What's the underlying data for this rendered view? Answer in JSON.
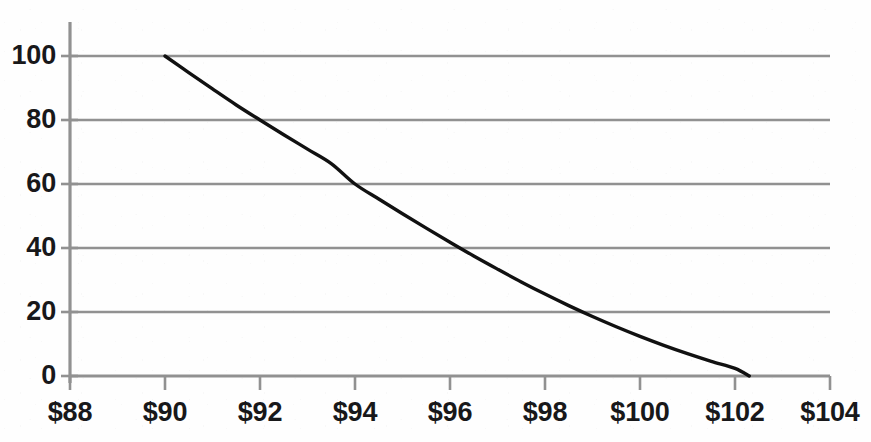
{
  "chart_data": {
    "type": "line",
    "title": "",
    "subtitle": "",
    "xlabel": "",
    "ylabel": "",
    "xlim": [
      88,
      104
    ],
    "ylim": [
      0,
      100
    ],
    "grid": "horizontal",
    "legend": "none",
    "x_tick_labels": [
      "$88",
      "$90",
      "$92",
      "$94",
      "$96",
      "$98",
      "$100",
      "$102",
      "$104"
    ],
    "x_tick_values": [
      88,
      90,
      92,
      94,
      96,
      98,
      100,
      102,
      104
    ],
    "y_tick_labels": [
      "0",
      "20",
      "40",
      "60",
      "80",
      "100"
    ],
    "y_tick_values": [
      0,
      20,
      40,
      60,
      80,
      100
    ],
    "series": [
      {
        "name": "curve",
        "color": "#111111",
        "x": [
          90.0,
          90.5,
          91.0,
          91.5,
          92.0,
          92.5,
          93.0,
          93.5,
          94.0,
          94.5,
          95.0,
          95.5,
          96.0,
          96.5,
          97.0,
          97.5,
          98.0,
          98.5,
          99.0,
          99.5,
          100.0,
          100.5,
          101.0,
          101.5,
          102.0,
          102.3
        ],
        "y": [
          100.0,
          94.8,
          89.7,
          84.7,
          80.0,
          75.4,
          70.9,
          66.4,
          60.0,
          55.3,
          50.7,
          46.2,
          41.8,
          37.5,
          33.4,
          29.4,
          25.6,
          22.0,
          18.6,
          15.4,
          12.4,
          9.6,
          7.0,
          4.6,
          2.4,
          0.0
        ]
      }
    ],
    "annotations": [],
    "notes": {
      "y_at_x90": 100,
      "y_at_x92": 80,
      "y_at_x94": 60,
      "x_at_y40": 96.2,
      "x_at_y20": 98.8,
      "x_at_y0": 102.3
    }
  },
  "axes": {
    "gridline_color": "#8f8f8f",
    "axis_color": "#8f8f8f",
    "curve_color": "#111111",
    "label_color": "#18181a",
    "background": "#fefefe"
  },
  "icons": {
    "none": ""
  }
}
